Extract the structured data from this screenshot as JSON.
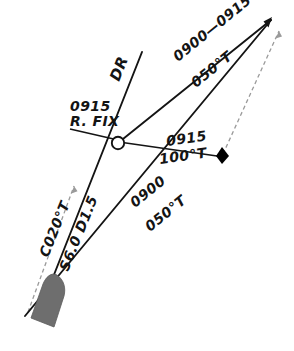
{
  "diagram": {
    "background_color": "#ffffff",
    "line_color": "#141414",
    "dashed_color": "#9a9a9a",
    "ship_color": "#6e6e6e",
    "marker_color": "#000000"
  },
  "labels": {
    "dr": "DR",
    "fix_time": "0915",
    "fix_name": "R. FIX",
    "upper_leg_time": "0900—0915",
    "upper_leg_course": "050°T",
    "lower_leg_time": "0900",
    "lower_leg_course": "050°T",
    "bearing_time": "0915",
    "bearing_course": "100°T",
    "set_course": "C020°T",
    "speed_distance": "S6.0 D1.5"
  },
  "symbols": {
    "fix_circle": "fix-circle-symbol",
    "estimated_position": "black-diamond-marker",
    "vessel": "ship-silhouette",
    "arrow_solid": "solid-arrowhead",
    "arrow_dashed": "dashed-arrowhead"
  },
  "geometry": {
    "fix": {
      "x": 118,
      "y": 143
    },
    "diamond": {
      "x": 222,
      "y": 156
    },
    "ship": {
      "x": 52,
      "y": 302
    },
    "upper_arrow": {
      "x": 272,
      "y": 18
    },
    "dashed_arrow": {
      "x": 278,
      "y": 28
    },
    "left_arrow": {
      "x": 73,
      "y": 183
    },
    "dr_top": {
      "x": 142,
      "y": 52
    },
    "track_start": {
      "x": 25,
      "y": 315
    }
  }
}
